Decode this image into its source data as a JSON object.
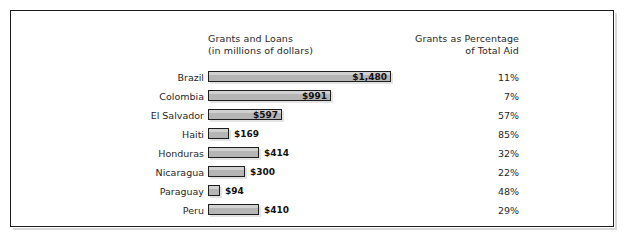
{
  "figure": {
    "frame_color": "#1c1c1c",
    "background": "#ffffff"
  },
  "headers": {
    "bars_line1": "Grants and Loans",
    "bars_line2": "(in millions of dollars)",
    "pct_line1": "Grants as Percentage",
    "pct_line2": "of Total Aid"
  },
  "chart_data": {
    "type": "bar",
    "title": "Grants and Loans (in millions of dollars)",
    "subtitle": "Grants as Percentage of Total Aid",
    "orientation": "horizontal",
    "xlabel": "",
    "ylabel": "",
    "xlim": [
      0,
      1480
    ],
    "grid": false,
    "legend": "none",
    "categories": [
      "Brazil",
      "Colombia",
      "El Salvador",
      "Haiti",
      "Honduras",
      "Nicaragua",
      "Paraguay",
      "Peru"
    ],
    "values": [
      1480,
      991,
      597,
      169,
      414,
      300,
      94,
      410
    ],
    "value_labels": [
      "$1,480",
      "$991",
      "$597",
      "$169",
      "$414",
      "$300",
      "$94",
      "$410"
    ],
    "series": [
      {
        "name": "Grants and Loans (in millions of dollars)",
        "values": [
          1480,
          991,
          597,
          169,
          414,
          300,
          94,
          410
        ]
      },
      {
        "name": "Grants as Percentage of Total Aid",
        "values": [
          11,
          7,
          57,
          85,
          32,
          22,
          48,
          29
        ]
      }
    ],
    "percent_labels": [
      "11%",
      "7%",
      "57%",
      "85%",
      "32%",
      "22%",
      "48%",
      "29%"
    ],
    "bar_fill": "#b5b5b5",
    "bar_border": "#1d1d1d"
  },
  "rows": [
    {
      "country": "Brazil",
      "value": 1480,
      "value_label": "$1,480",
      "percent": "11%"
    },
    {
      "country": "Colombia",
      "value": 991,
      "value_label": "$991",
      "percent": "7%"
    },
    {
      "country": "El Salvador",
      "value": 597,
      "value_label": "$597",
      "percent": "57%"
    },
    {
      "country": "Haiti",
      "value": 169,
      "value_label": "$169",
      "percent": "85%"
    },
    {
      "country": "Honduras",
      "value": 414,
      "value_label": "$414",
      "percent": "32%"
    },
    {
      "country": "Nicaragua",
      "value": 300,
      "value_label": "$300",
      "percent": "22%"
    },
    {
      "country": "Paraguay",
      "value": 94,
      "value_label": "$94",
      "percent": "48%"
    },
    {
      "country": "Peru",
      "value": 410,
      "value_label": "$410",
      "percent": "29%"
    }
  ]
}
